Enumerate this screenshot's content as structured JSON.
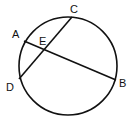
{
  "diagram": {
    "type": "circle-intersecting-chords",
    "circle": {
      "cx": 68,
      "cy": 66,
      "r": 49
    },
    "points": [
      {
        "name": "A",
        "x": 24,
        "y": 41,
        "lx": 12,
        "ly": 38
      },
      {
        "name": "C",
        "x": 72,
        "y": 17,
        "lx": 70,
        "ly": 13
      },
      {
        "name": "D",
        "x": 19,
        "y": 79,
        "lx": 6,
        "ly": 91
      },
      {
        "name": "B",
        "x": 116,
        "y": 80,
        "lx": 119,
        "ly": 87
      },
      {
        "name": "E",
        "x": 45,
        "y": 49,
        "lx": 39,
        "ly": 45
      }
    ],
    "chords": [
      {
        "from": "A",
        "to": "B"
      },
      {
        "from": "C",
        "to": "D"
      }
    ],
    "stroke": "#111111"
  }
}
